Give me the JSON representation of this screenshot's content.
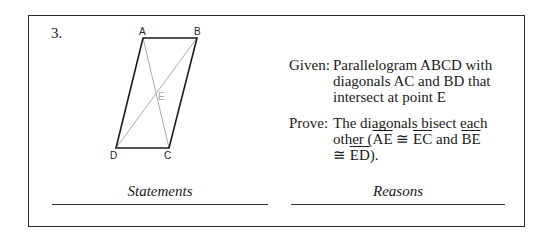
{
  "problem": {
    "number": "3.",
    "diagram": {
      "vertices": {
        "A": "A",
        "B": "B",
        "C": "C",
        "D": "D",
        "E": "E"
      }
    },
    "given": {
      "label": "Given:",
      "lines": [
        "Parallelogram ABCD with",
        "diagonals AC and BD that",
        "intersect at point E"
      ]
    },
    "prove": {
      "label": "Prove:",
      "line1": "The diagonals bisect each",
      "line2_pre": "other (",
      "seg1": "AE",
      "cong1": " ≅ ",
      "seg2": "EC",
      "and": " and ",
      "seg3": "BE",
      "cong2": "≅ ",
      "seg4": "ED",
      "end": ")."
    },
    "columns": {
      "statements": "Statements",
      "reasons": "Reasons"
    }
  }
}
